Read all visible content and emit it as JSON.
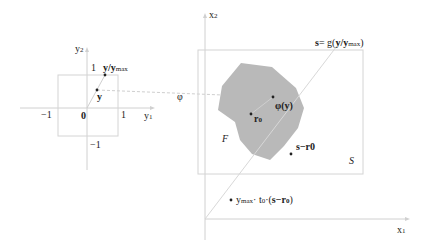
{
  "left_system": {
    "axis_x_label": "y",
    "axis_x_sub": "1",
    "axis_y_label": "y",
    "axis_y_sub": "2",
    "tick_neg1_x": "−1",
    "tick_pos1_x": "1",
    "tick_pos1_y": "1",
    "tick_neg1_y": "−1",
    "origin": "0",
    "point_y": "y",
    "point_ynorm": "y/y",
    "point_ynorm_sub": "max"
  },
  "mapping": {
    "label": "φ"
  },
  "right_system": {
    "axis_x_label": "x",
    "axis_x_sub": "1",
    "axis_y_label": "x",
    "axis_y_sub": "2",
    "region_S": "S",
    "region_F": "F",
    "point_phi": "φ(y)",
    "point_r0": "r",
    "point_r0_sub": "0",
    "point_s_minus_r0": "s−r0",
    "s_label_prefix": "s",
    "s_label_eq": "= g(",
    "s_label_y": "y/y",
    "s_label_sub": "max",
    "s_label_close": ")",
    "bottom_label_a": "y",
    "bottom_label_a_sub": "max",
    "bottom_label_b": "· t",
    "bottom_label_b_sub": "0",
    "bottom_label_c": "·(",
    "bottom_label_d": "s−r",
    "bottom_label_d_sub": "0",
    "bottom_label_e": ")"
  },
  "colors": {
    "axis": "#cfcfcf",
    "box": "#d4d4d4",
    "blob": "#b9b9b9",
    "point": "#222222"
  }
}
